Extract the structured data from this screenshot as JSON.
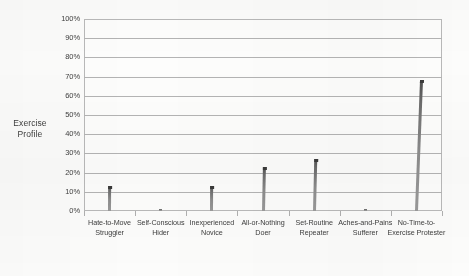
{
  "chart_data": {
    "type": "bar",
    "title": "",
    "xlabel": "",
    "ylabel": "Exercise Profile",
    "ylabel_lines": [
      "Exercise",
      "Profile"
    ],
    "ylim": [
      0,
      100
    ],
    "y_tick_labels": [
      "100%",
      "90%",
      "80%",
      "70%",
      "60%",
      "50%",
      "40%",
      "30%",
      "20%",
      "10%",
      "0%"
    ],
    "y_tick_values": [
      100,
      90,
      80,
      70,
      60,
      50,
      40,
      30,
      20,
      10,
      0
    ],
    "grid": true,
    "grid_axis": "y",
    "legend": "none",
    "categories": [
      "Hate-to-Move Struggler",
      "Self-Conscious Hider",
      "Inexperienced Novice",
      "All-or-Nothing Doer",
      "Set-Routine Repeater",
      "Aches-and-Pains Sufferer",
      "No-Time-to-Exercise Protester"
    ],
    "category_lines": [
      [
        "Hate-to-Move",
        "Struggler"
      ],
      [
        "Self-Conscious",
        "Hider"
      ],
      [
        "Inexperienced",
        "Novice"
      ],
      [
        "All-or-Nothing",
        "Doer"
      ],
      [
        "Set-Routine",
        "Repeater"
      ],
      [
        "Aches-and-Pains",
        "Sufferer"
      ],
      [
        "No-Time-to-",
        "Exercise Protester"
      ]
    ],
    "values": [
      13,
      1,
      13,
      23,
      27,
      1,
      68
    ],
    "value_unit": "%",
    "bar_color": "#6d6d6d",
    "grid_color": "#b4b4b4",
    "frame_color": "#b9b9b9",
    "background_color": "#fdfdfc",
    "text_color": "#3d3d3d"
  }
}
